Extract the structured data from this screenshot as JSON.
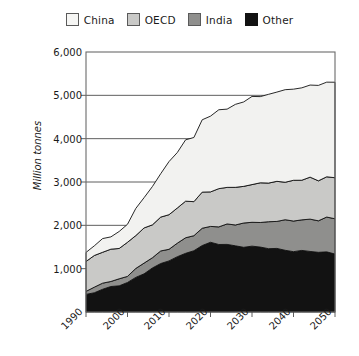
{
  "chart_data": {
    "type": "area",
    "stacked": true,
    "title": "",
    "subtitle": "",
    "xlabel": "",
    "ylabel": "Million tonnes",
    "x": [
      1990,
      2000,
      2010,
      2020,
      2030,
      2040,
      2050
    ],
    "xlim": [
      1990,
      2050
    ],
    "ylim": [
      0,
      6000
    ],
    "yticks": [
      1000,
      2000,
      3000,
      4000,
      5000,
      6000
    ],
    "ytick_labels": [
      "1,000",
      "2,000",
      "3,000",
      "4,000",
      "5,000",
      "6,000"
    ],
    "xtick_labels": [
      "1990",
      "2000",
      "2010",
      "2020",
      "2030",
      "2040",
      "2050"
    ],
    "grid": true,
    "legend_position": "top",
    "stack_order_bottom_to_top": [
      "Other",
      "India",
      "OECD",
      "China"
    ],
    "series": [
      {
        "name": "China",
        "color": "#f2f2f0",
        "values": [
          180,
          430,
          1180,
          1750,
          2000,
          2120,
          2200
        ]
      },
      {
        "name": "OECD",
        "color": "#c9c9c7",
        "values": [
          690,
          760,
          800,
          830,
          880,
          920,
          950
        ]
      },
      {
        "name": "India",
        "color": "#8f8f8d",
        "values": [
          90,
          170,
          300,
          390,
          560,
          700,
          800
        ]
      },
      {
        "name": "Other",
        "color": "#121212",
        "values": [
          390,
          690,
          1200,
          1590,
          1500,
          1420,
          1350
        ]
      }
    ],
    "totals": [
      1350,
      2050,
      3480,
      4560,
      4940,
      5160,
      5300
    ]
  },
  "legend": {
    "items": [
      {
        "label": "China",
        "color": "#f2f2f0"
      },
      {
        "label": "OECD",
        "color": "#c9c9c7"
      },
      {
        "label": "India",
        "color": "#8f8f8d"
      },
      {
        "label": "Other",
        "color": "#121212"
      }
    ]
  },
  "axes": {
    "y_label": "Million tonnes",
    "y_tick_labels": [
      "6,000",
      "5,000",
      "4,000",
      "3,000",
      "2,000",
      "1,000"
    ],
    "x_tick_labels": [
      "1990",
      "2000",
      "2010",
      "2020",
      "2030",
      "2040",
      "2050"
    ]
  }
}
